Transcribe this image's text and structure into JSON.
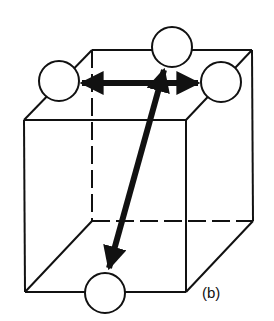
{
  "diagram": {
    "type": "cube-with-atoms",
    "label": "(b)",
    "colors": {
      "stroke": "#111111",
      "fill": "#ffffff"
    },
    "atoms": [
      {
        "id": "top-center",
        "cx": 172,
        "cy": 47
      },
      {
        "id": "left",
        "cx": 59,
        "cy": 81
      },
      {
        "id": "right",
        "cx": 221,
        "cy": 82
      },
      {
        "id": "bottom",
        "cx": 105,
        "cy": 293
      }
    ],
    "arrows": [
      {
        "id": "horizontal-double",
        "from": "left",
        "to": "right",
        "style": "double-headed"
      },
      {
        "id": "diagonal",
        "from": "top-center",
        "to": "bottom",
        "style": "single-headed"
      }
    ]
  }
}
